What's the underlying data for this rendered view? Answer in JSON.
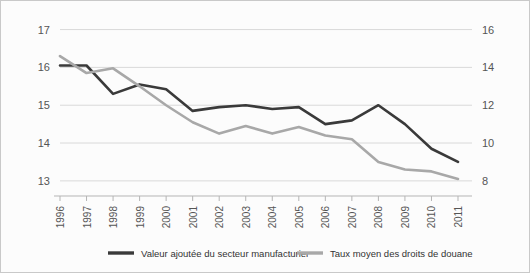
{
  "chart_data": {
    "type": "line",
    "title": "",
    "subtitle": "",
    "xlabel": "",
    "ylabel": "",
    "grid": true,
    "legend_position": "bottom",
    "categories": [
      "1996",
      "1997",
      "1998",
      "1999",
      "2000",
      "2001",
      "2002",
      "2003",
      "2004",
      "2005",
      "2006",
      "2007",
      "2008",
      "2009",
      "2010",
      "2011"
    ],
    "axes": {
      "left": {
        "ticks": [
          "13",
          "14",
          "15",
          "16",
          "17"
        ],
        "tick_values": [
          13,
          14,
          15,
          16,
          17
        ],
        "ylim": [
          12.6,
          17.2
        ]
      },
      "right": {
        "ticks": [
          "8",
          "10",
          "12",
          "14",
          "16"
        ],
        "tick_values": [
          8,
          10,
          12,
          14,
          16
        ],
        "ylim": [
          7.2,
          16.4
        ]
      }
    },
    "series": [
      {
        "name": "Valeur ajoutée du secteur manufacturier",
        "axis": "left",
        "color": "#3a3a3a",
        "values": [
          16.05,
          16.05,
          15.3,
          15.55,
          15.42,
          14.85,
          14.95,
          15.0,
          14.9,
          14.95,
          14.5,
          14.6,
          15.0,
          14.5,
          13.85,
          13.5
        ]
      },
      {
        "name": "Taux moyen des droits de douane",
        "axis": "right",
        "color": "#a8a8a8",
        "values": [
          14.6,
          13.7,
          13.95,
          13.0,
          12.0,
          11.1,
          10.5,
          10.9,
          10.5,
          10.85,
          10.4,
          10.2,
          9.0,
          8.6,
          8.5,
          8.1
        ]
      }
    ]
  },
  "legend": {
    "items": [
      {
        "label": "Valeur ajoutée du secteur manufacturier",
        "color": "#3a3a3a"
      },
      {
        "label": "Taux moyen des droits de douane",
        "color": "#a8a8a8"
      }
    ]
  }
}
